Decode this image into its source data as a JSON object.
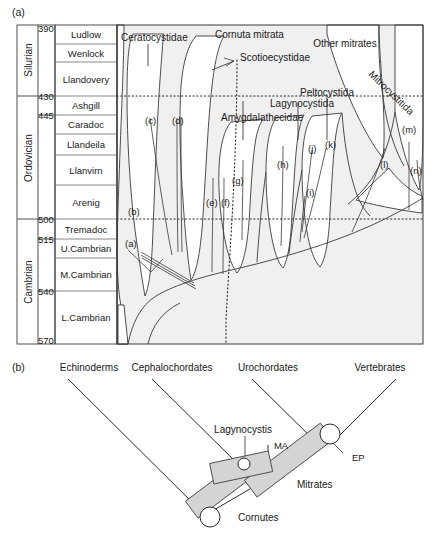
{
  "figure": {
    "panel_a_tag": "(a)",
    "panel_b_tag": "(b)"
  },
  "panel_a": {
    "axis": {
      "unit_note": "",
      "tick_values": [
        "390",
        "430",
        "445",
        "500",
        "515",
        "540",
        "570"
      ]
    },
    "periods": [
      {
        "name": "Silurian"
      },
      {
        "name": "Ordovician"
      },
      {
        "name": "Cambrian"
      }
    ],
    "stages": [
      {
        "name": "Ludlow"
      },
      {
        "name": "Wenlock"
      },
      {
        "name": "Llandovery"
      },
      {
        "name": "Ashgill"
      },
      {
        "name": "Caradoc"
      },
      {
        "name": "Llandeila"
      },
      {
        "name": "Llanvirn"
      },
      {
        "name": "Arenig"
      },
      {
        "name": "Tremadoc"
      },
      {
        "name": "U.Cambrian"
      },
      {
        "name": "M.Cambrian"
      },
      {
        "name": "L.Cambrian"
      }
    ],
    "taxa": [
      {
        "name": "Ceratocystidae"
      },
      {
        "name": "Cornuta mitrata"
      },
      {
        "name": "Scotioecystidae"
      },
      {
        "name": "Other mitrates"
      },
      {
        "name": "Peltocystida"
      },
      {
        "name": "Lagynocystida"
      },
      {
        "name": "Amygdalathecidae"
      },
      {
        "name": "Mitrocystitida"
      }
    ],
    "lineage_letters": [
      {
        "label": "(a)"
      },
      {
        "label": "(b)"
      },
      {
        "label": "(c)"
      },
      {
        "label": "(d)"
      },
      {
        "label": "(e)"
      },
      {
        "label": "(f)"
      },
      {
        "label": "(g)"
      },
      {
        "label": "(h)"
      },
      {
        "label": "(i)"
      },
      {
        "label": "(j)"
      },
      {
        "label": "(k)"
      },
      {
        "label": "(l)"
      },
      {
        "label": "(m)"
      },
      {
        "label": "(n)"
      }
    ],
    "colors": {
      "fill": "#f0f0f0",
      "stroke": "#3a3a3a",
      "dotted": "#2b2b2b",
      "frame": "#3a3a3a"
    }
  },
  "panel_b": {
    "top_labels": [
      {
        "name": "Echinoderms"
      },
      {
        "name": "Cephalochordates"
      },
      {
        "name": "Urochordates"
      },
      {
        "name": "Vertebrates"
      }
    ],
    "inner_labels": [
      {
        "name": "Lagynocystis"
      },
      {
        "name": "MA"
      },
      {
        "name": "EP"
      },
      {
        "name": "Mitrates"
      },
      {
        "name": "Cornutes"
      }
    ],
    "colors": {
      "bar_fill": "#d4d4d4",
      "bar_stroke": "#4a4a4a",
      "line": "#2b2b2b",
      "node_fill": "#ffffff"
    }
  }
}
